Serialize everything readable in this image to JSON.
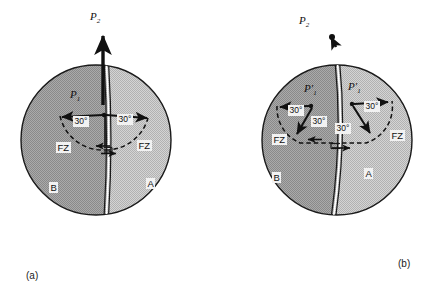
{
  "figure": {
    "colors": {
      "plate_a_fill": "#c6c6c6",
      "plate_b_fill": "#9c9c9c",
      "outline": "#1a1a1a",
      "ridge": "#ffffff",
      "background": "#ffffff",
      "label_bg": "#f2f2f2"
    },
    "panels": [
      {
        "id": "a",
        "caption": "(a)",
        "circle": {
          "cx": 96,
          "cy": 140,
          "r": 75
        },
        "plate_left_label": "B",
        "plate_right_label": "A",
        "pole_labels": [
          {
            "name": "P2",
            "text": "P",
            "sub": "2"
          },
          {
            "name": "P1",
            "text": "P",
            "sub": "1"
          }
        ],
        "angle_labels": [
          "30°",
          "30°"
        ],
        "fracture_zone_labels": [
          "FZ",
          "FZ"
        ]
      },
      {
        "id": "b",
        "caption": "(b)",
        "circle": {
          "cx": 337,
          "cy": 140,
          "r": 75
        },
        "plate_left_label": "B",
        "plate_right_label": "A",
        "pole_labels": [
          {
            "name": "P2",
            "text": "P",
            "sub": "2"
          },
          {
            "name": "P1-prime-left",
            "text": "P′",
            "sub": "1"
          },
          {
            "name": "P1-prime-right",
            "text": "P′",
            "sub": "1"
          }
        ],
        "angle_labels": [
          "30°",
          "30°",
          "30°",
          "30°"
        ],
        "fracture_zone_labels": [
          "FZ",
          "FZ"
        ]
      }
    ]
  }
}
